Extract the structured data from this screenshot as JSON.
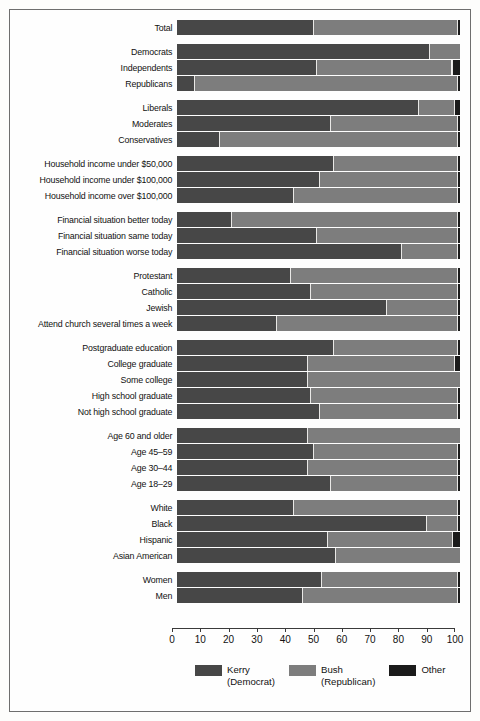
{
  "chart_data": {
    "type": "bar",
    "orientation": "horizontal",
    "stacked": true,
    "title": "",
    "subtitle": "",
    "xlabel": "",
    "ylabel": "",
    "xlim": [
      0,
      100
    ],
    "grid": false,
    "legend_position": "bottom",
    "axis": {
      "ticks": [
        0,
        10,
        20,
        30,
        40,
        50,
        60,
        70,
        80,
        90,
        100
      ],
      "tick_labels": [
        "0",
        "10",
        "20",
        "30",
        "40",
        "50",
        "60",
        "70",
        "80",
        "90",
        "100"
      ]
    },
    "legend": [
      {
        "name": "Kerry",
        "sub": "(Democrat)",
        "color": "#474747"
      },
      {
        "name": "Bush",
        "sub": "(Republican)",
        "color": "#7d7d7d"
      },
      {
        "name": "Other",
        "sub": "",
        "color": "#1b1b1b"
      }
    ],
    "series": [
      {
        "name": "Kerry (Democrat)",
        "color": "#474747"
      },
      {
        "name": "Bush (Republican)",
        "color": "#7d7d7d"
      },
      {
        "name": "Other",
        "color": "#1b1b1b"
      }
    ],
    "groups": [
      {
        "id": "total",
        "rows": [
          {
            "label": "Total",
            "values": [
              48,
              51,
              1
            ]
          }
        ]
      },
      {
        "id": "party",
        "rows": [
          {
            "label": "Democrats",
            "values": [
              89,
              11,
              0
            ]
          },
          {
            "label": "Independents",
            "values": [
              49,
              48,
              3
            ]
          },
          {
            "label": "Republicans",
            "values": [
              6,
              93,
              1
            ]
          }
        ]
      },
      {
        "id": "ideology",
        "rows": [
          {
            "label": "Liberals",
            "values": [
              85,
              13,
              2
            ]
          },
          {
            "label": "Moderates",
            "values": [
              54,
              45,
              1
            ]
          },
          {
            "label": "Conservatives",
            "values": [
              15,
              84,
              1
            ]
          }
        ]
      },
      {
        "id": "income",
        "rows": [
          {
            "label": "Household income under $50,000",
            "values": [
              55,
              44,
              1
            ]
          },
          {
            "label": "Household income under $100,000",
            "values": [
              50,
              49,
              1
            ]
          },
          {
            "label": "Household income over $100,000",
            "values": [
              41,
              58,
              1
            ]
          }
        ]
      },
      {
        "id": "financial-situation",
        "rows": [
          {
            "label": "Financial situation better today",
            "values": [
              19,
              80,
              1
            ]
          },
          {
            "label": "Financial situation same today",
            "values": [
              49,
              50,
              1
            ]
          },
          {
            "label": "Financial situation worse today",
            "values": [
              79,
              20,
              1
            ]
          }
        ]
      },
      {
        "id": "religion",
        "rows": [
          {
            "label": "Protestant",
            "values": [
              40,
              59,
              1
            ]
          },
          {
            "label": "Catholic",
            "values": [
              47,
              52,
              1
            ]
          },
          {
            "label": "Jewish",
            "values": [
              74,
              25,
              1
            ]
          },
          {
            "label": "Attend church several times a week",
            "values": [
              35,
              64,
              1
            ]
          }
        ]
      },
      {
        "id": "education",
        "rows": [
          {
            "label": "Postgraduate education",
            "values": [
              55,
              44,
              1
            ]
          },
          {
            "label": "College graduate",
            "values": [
              46,
              52,
              2
            ]
          },
          {
            "label": "Some college",
            "values": [
              46,
              54,
              0
            ]
          },
          {
            "label": "High school graduate",
            "values": [
              47,
              52,
              1
            ]
          },
          {
            "label": "Not high school graduate",
            "values": [
              50,
              49,
              1
            ]
          }
        ]
      },
      {
        "id": "age",
        "rows": [
          {
            "label": "Age 60 and older",
            "values": [
              46,
              54,
              0
            ]
          },
          {
            "label": "Age 45–59",
            "values": [
              48,
              51,
              1
            ]
          },
          {
            "label": "Age 30–44",
            "values": [
              46,
              53,
              1
            ]
          },
          {
            "label": "Age 18–29",
            "values": [
              54,
              45,
              1
            ]
          }
        ]
      },
      {
        "id": "race",
        "rows": [
          {
            "label": "White",
            "values": [
              41,
              58,
              1
            ]
          },
          {
            "label": "Black",
            "values": [
              88,
              11,
              1
            ]
          },
          {
            "label": "Hispanic",
            "values": [
              53,
              44,
              3
            ]
          },
          {
            "label": "Asian American",
            "values": [
              56,
              44,
              0
            ]
          }
        ]
      },
      {
        "id": "gender",
        "rows": [
          {
            "label": "Women",
            "values": [
              51,
              48,
              1
            ]
          },
          {
            "label": "Men",
            "values": [
              44,
              55,
              1
            ]
          }
        ]
      }
    ]
  }
}
